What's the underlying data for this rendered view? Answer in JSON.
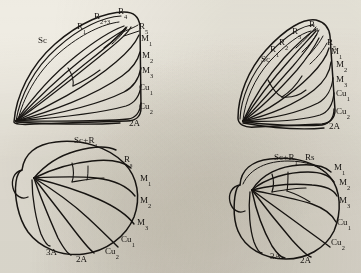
{
  "figure": {
    "kind": "butterfly-wing-venation-plate",
    "background_color": "#efece3",
    "ink_color": "#1a1714",
    "panel_count": 4
  },
  "panels": {
    "top_left": {
      "name": "forewing-fused-radius",
      "wing_type": "forewing",
      "position": "top-left",
      "labels": [
        {
          "text": "Sc",
          "sub": "",
          "x": 38,
          "y": 36
        },
        {
          "text": "R",
          "sub": "1",
          "x": 77,
          "y": 22
        },
        {
          "text": "R",
          "sub": "2+3",
          "x": 94,
          "y": 12
        },
        {
          "text": "R",
          "sub": "4",
          "x": 118,
          "y": 7
        },
        {
          "text": "R",
          "sub": "5",
          "x": 139,
          "y": 22
        },
        {
          "text": "M",
          "sub": "1",
          "x": 141,
          "y": 34
        },
        {
          "text": "M",
          "sub": "2",
          "x": 142,
          "y": 51
        },
        {
          "text": "M",
          "sub": "3",
          "x": 142,
          "y": 66
        },
        {
          "text": "Cu",
          "sub": "1",
          "x": 139,
          "y": 83
        },
        {
          "text": "Cu",
          "sub": "2",
          "x": 139,
          "y": 102
        },
        {
          "text": "2A",
          "sub": "",
          "x": 129,
          "y": 119
        }
      ]
    },
    "top_right": {
      "name": "forewing-separate-radius",
      "wing_type": "forewing",
      "position": "top-right",
      "labels": [
        {
          "text": "Sc",
          "sub": "",
          "x": 261,
          "y": 55
        },
        {
          "text": "R",
          "sub": "1",
          "x": 270,
          "y": 45
        },
        {
          "text": "R",
          "sub": "2",
          "x": 279,
          "y": 38
        },
        {
          "text": "R",
          "sub": "3",
          "x": 292,
          "y": 27
        },
        {
          "text": "R",
          "sub": "4",
          "x": 309,
          "y": 20
        },
        {
          "text": "R",
          "sub": "5",
          "x": 327,
          "y": 38
        },
        {
          "text": "M",
          "sub": "1",
          "x": 331,
          "y": 47
        },
        {
          "text": "M",
          "sub": "2",
          "x": 336,
          "y": 60
        },
        {
          "text": "M",
          "sub": "3",
          "x": 336,
          "y": 75
        },
        {
          "text": "Cu",
          "sub": "1",
          "x": 336,
          "y": 89
        },
        {
          "text": "Cu",
          "sub": "2",
          "x": 336,
          "y": 107
        },
        {
          "text": "2A",
          "sub": "",
          "x": 329,
          "y": 122
        }
      ]
    },
    "bottom_left": {
      "name": "hindwing-discrete-subcosta",
      "wing_type": "hindwing",
      "position": "bottom-left",
      "labels": [
        {
          "text": "Sc+R",
          "sub": "1",
          "x": 74,
          "y": 136
        },
        {
          "text": "R",
          "sub": "s",
          "x": 124,
          "y": 155
        },
        {
          "text": "M",
          "sub": "1",
          "x": 140,
          "y": 174
        },
        {
          "text": "M",
          "sub": "2",
          "x": 140,
          "y": 196
        },
        {
          "text": "M",
          "sub": "3",
          "x": 137,
          "y": 218
        },
        {
          "text": "Cu",
          "sub": "1",
          "x": 121,
          "y": 235
        },
        {
          "text": "Cu",
          "sub": "2",
          "x": 105,
          "y": 247
        },
        {
          "text": "2A",
          "sub": "",
          "x": 76,
          "y": 255
        },
        {
          "text": "3A",
          "sub": "",
          "x": 46,
          "y": 248
        }
      ]
    },
    "bottom_right": {
      "name": "hindwing-fused-subcosta",
      "wing_type": "hindwing",
      "position": "bottom-right",
      "labels": [
        {
          "text": "Sc+R",
          "sub": "1",
          "x": 274,
          "y": 153
        },
        {
          "text": "Rs",
          "sub": "",
          "x": 305,
          "y": 153
        },
        {
          "text": "M",
          "sub": "1",
          "x": 334,
          "y": 163
        },
        {
          "text": "M",
          "sub": "2",
          "x": 339,
          "y": 178
        },
        {
          "text": "M",
          "sub": "3",
          "x": 339,
          "y": 196
        },
        {
          "text": "Cu",
          "sub": "1",
          "x": 337,
          "y": 218
        },
        {
          "text": "Cu",
          "sub": "2",
          "x": 331,
          "y": 238
        },
        {
          "text": "2A",
          "sub": "",
          "x": 300,
          "y": 256
        },
        {
          "text": "3A",
          "sub": "",
          "x": 270,
          "y": 252
        }
      ]
    }
  }
}
